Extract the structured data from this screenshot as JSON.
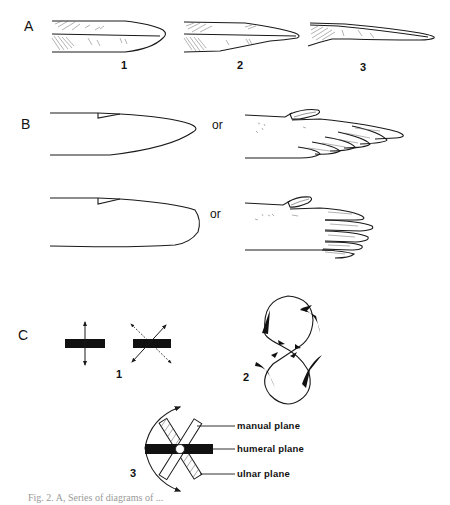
{
  "figure": {
    "panels": {
      "A": {
        "label": "A",
        "items": [
          {
            "number": "1",
            "description": "feather outline with symmetric rounded tip"
          },
          {
            "number": "2",
            "description": "feather outline with moderately tapered tip"
          },
          {
            "number": "3",
            "description": "feather outline with narrow elongated tip"
          }
        ]
      },
      "B": {
        "label": "B",
        "rows": [
          {
            "left": "pointed wing outline",
            "connector": "or",
            "right": "pointed wing with primaries"
          },
          {
            "left": "rounded wing outline",
            "connector": "or",
            "right": "rounded wing with primaries"
          }
        ]
      },
      "C": {
        "label": "C",
        "subfigures": [
          {
            "number": "1",
            "description": "bar with vertical arrow and bar with diagonal crossed arrows"
          },
          {
            "number": "2",
            "description": "figure-eight stroke path with feather positions"
          },
          {
            "number": "3",
            "description": "rotating planes diagram"
          }
        ],
        "annotations": {
          "manual": "manual plane",
          "humeral": "humeral plane",
          "ulnar": "ulnar plane"
        }
      }
    },
    "caption": "Fig. 2.   A, Series of diagrams of ..."
  },
  "colors": {
    "ink": "#1a1a1a",
    "background": "#ffffff"
  }
}
